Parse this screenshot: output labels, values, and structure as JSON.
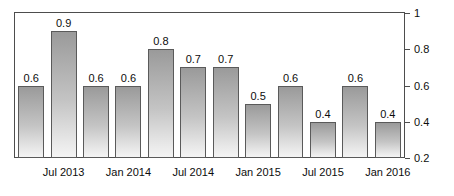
{
  "chart_data": {
    "type": "bar",
    "title": "",
    "subtitle": "",
    "xlabel": "",
    "ylabel": "",
    "ylim": [
      0.2,
      1.0
    ],
    "grid": false,
    "legend": null,
    "y_axis_position": "right",
    "y_ticks": [
      {
        "value": 1.0,
        "label": "1"
      },
      {
        "value": 0.8,
        "label": "0.8"
      },
      {
        "value": 0.6,
        "label": "0.6"
      },
      {
        "value": 0.4,
        "label": "0.4"
      },
      {
        "value": 0.2,
        "label": "0.2"
      }
    ],
    "categories": [
      "1",
      "2",
      "3",
      "4",
      "5",
      "6",
      "7",
      "8",
      "9",
      "10",
      "11",
      "12"
    ],
    "values": [
      0.6,
      0.9,
      0.6,
      0.6,
      0.8,
      0.7,
      0.7,
      0.5,
      0.6,
      0.4,
      0.6,
      0.4
    ],
    "data_labels": [
      "0.6",
      "0.9",
      "0.6",
      "0.6",
      "0.8",
      "0.7",
      "0.7",
      "0.5",
      "0.6",
      "0.4",
      "0.6",
      "0.4"
    ],
    "x_tick_labels": [
      {
        "bar_index": 1,
        "label": "Jul 2013"
      },
      {
        "bar_index": 3,
        "label": "Jan 2014"
      },
      {
        "bar_index": 5,
        "label": "Jul 2014"
      },
      {
        "bar_index": 7,
        "label": "Jan 2015"
      },
      {
        "bar_index": 9,
        "label": "Jul 2015"
      },
      {
        "bar_index": 11,
        "label": "Jan 2016"
      }
    ],
    "colors": {
      "bar_fill_top": "#9a9a9a",
      "bar_fill_bottom": "#f4f4f4",
      "bar_border": "#5a5a5a",
      "axis": "#4d4d4d",
      "text": "#0d0d0d",
      "background": "#ffffff"
    }
  }
}
